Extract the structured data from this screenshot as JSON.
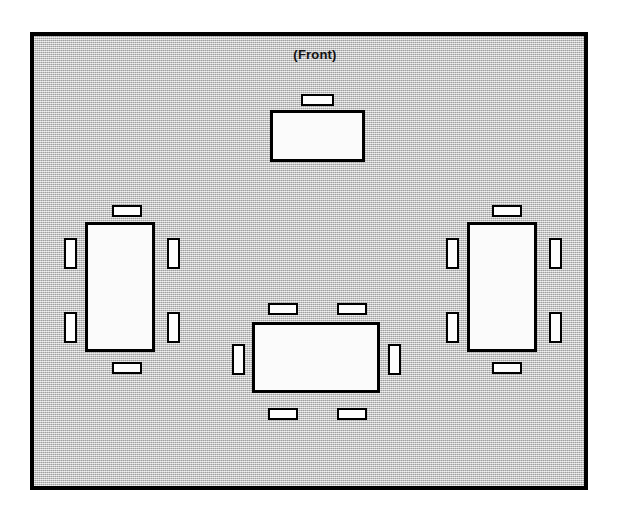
{
  "diagram": {
    "title": "(Front)",
    "kind": "room-seating-layout",
    "colors": {
      "room_fill": "#c8c8c8",
      "outline": "#000000",
      "table_fill": "#fbfbfb",
      "chair_fill": "#fdfdfd",
      "page_background": "#ffffff"
    },
    "room": {
      "x": 30,
      "y": 32,
      "width": 558,
      "height": 458
    },
    "front_label": {
      "text": "(Front)",
      "x": 262,
      "y": 48,
      "width": 106
    },
    "tables": [
      {
        "name": "front-table",
        "label": "",
        "x": 270,
        "y": 110,
        "width": 95,
        "height": 52,
        "orientation": "horizontal",
        "seat_count": 1,
        "chairs": [
          {
            "name": "chair-front-table-top-1",
            "x": 301,
            "y": 94,
            "width": 33,
            "height": 12,
            "orientation": "horizontal"
          }
        ]
      },
      {
        "name": "left-table",
        "label": "",
        "x": 85,
        "y": 222,
        "width": 70,
        "height": 130,
        "orientation": "vertical",
        "seat_count": 6,
        "chairs": [
          {
            "name": "chair-left-table-top-1",
            "x": 112,
            "y": 205,
            "width": 30,
            "height": 12,
            "orientation": "horizontal"
          },
          {
            "name": "chair-left-table-left-1",
            "x": 64,
            "y": 238,
            "width": 13,
            "height": 31,
            "orientation": "vertical"
          },
          {
            "name": "chair-left-table-left-2",
            "x": 64,
            "y": 312,
            "width": 13,
            "height": 31,
            "orientation": "vertical"
          },
          {
            "name": "chair-left-table-right-1",
            "x": 167,
            "y": 238,
            "width": 13,
            "height": 31,
            "orientation": "vertical"
          },
          {
            "name": "chair-left-table-right-2",
            "x": 167,
            "y": 312,
            "width": 13,
            "height": 31,
            "orientation": "vertical"
          },
          {
            "name": "chair-left-table-bottom-1",
            "x": 112,
            "y": 362,
            "width": 30,
            "height": 12,
            "orientation": "horizontal"
          }
        ]
      },
      {
        "name": "right-table",
        "label": "",
        "x": 467,
        "y": 222,
        "width": 70,
        "height": 130,
        "orientation": "vertical",
        "seat_count": 6,
        "chairs": [
          {
            "name": "chair-right-table-top-1",
            "x": 492,
            "y": 205,
            "width": 30,
            "height": 12,
            "orientation": "horizontal"
          },
          {
            "name": "chair-right-table-left-1",
            "x": 446,
            "y": 238,
            "width": 13,
            "height": 31,
            "orientation": "vertical"
          },
          {
            "name": "chair-right-table-left-2",
            "x": 446,
            "y": 312,
            "width": 13,
            "height": 31,
            "orientation": "vertical"
          },
          {
            "name": "chair-right-table-right-1",
            "x": 549,
            "y": 238,
            "width": 13,
            "height": 31,
            "orientation": "vertical"
          },
          {
            "name": "chair-right-table-right-2",
            "x": 549,
            "y": 312,
            "width": 13,
            "height": 31,
            "orientation": "vertical"
          },
          {
            "name": "chair-right-table-bottom-1",
            "x": 492,
            "y": 362,
            "width": 30,
            "height": 12,
            "orientation": "horizontal"
          }
        ]
      },
      {
        "name": "center-table",
        "label": "",
        "x": 252,
        "y": 322,
        "width": 128,
        "height": 71,
        "orientation": "horizontal",
        "seat_count": 6,
        "chairs": [
          {
            "name": "chair-center-table-top-1",
            "x": 268,
            "y": 303,
            "width": 30,
            "height": 12,
            "orientation": "horizontal"
          },
          {
            "name": "chair-center-table-top-2",
            "x": 337,
            "y": 303,
            "width": 30,
            "height": 12,
            "orientation": "horizontal"
          },
          {
            "name": "chair-center-table-left-1",
            "x": 232,
            "y": 344,
            "width": 13,
            "height": 31,
            "orientation": "vertical"
          },
          {
            "name": "chair-center-table-right-1",
            "x": 388,
            "y": 344,
            "width": 13,
            "height": 31,
            "orientation": "vertical"
          },
          {
            "name": "chair-center-table-bottom-1",
            "x": 268,
            "y": 408,
            "width": 30,
            "height": 12,
            "orientation": "horizontal"
          },
          {
            "name": "chair-center-table-bottom-2",
            "x": 337,
            "y": 408,
            "width": 30,
            "height": 12,
            "orientation": "horizontal"
          }
        ]
      }
    ]
  }
}
